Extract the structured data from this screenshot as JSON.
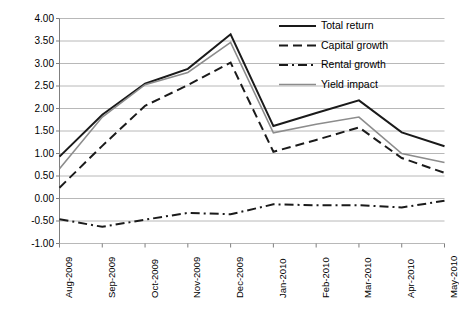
{
  "chart_data": {
    "type": "line",
    "title": "",
    "subtitle": "",
    "xlabel": "",
    "ylabel": "",
    "categories": [
      "Aug-2009",
      "Sep-2009",
      "Oct-2009",
      "Nov-2009",
      "Dec-2009",
      "Jan-2010",
      "Feb-2010",
      "Mar-2010",
      "Apr-2010",
      "May-2010"
    ],
    "ylim": [
      -1.0,
      4.0
    ],
    "ytick_labels": [
      "4.00",
      "3.50",
      "3.00",
      "2.50",
      "2.00",
      "1.50",
      "1.00",
      "0.50",
      "0.00",
      "-0.50",
      "-1.00"
    ],
    "ytick_values": [
      4.0,
      3.5,
      3.0,
      2.5,
      2.0,
      1.5,
      1.0,
      0.5,
      0.0,
      -0.5,
      -1.0
    ],
    "grid": true,
    "grid_axis": "y",
    "legend_position": "top-right",
    "series": [
      {
        "name": "Total return",
        "style": "solid",
        "color": "#1a1a1a",
        "width": 2.0,
        "values": [
          0.93,
          1.86,
          2.55,
          2.88,
          3.65,
          1.61,
          1.9,
          2.18,
          1.47,
          1.16
        ]
      },
      {
        "name": "Capital growth",
        "style": "dashed",
        "color": "#1a1a1a",
        "width": 2.0,
        "values": [
          0.24,
          1.17,
          2.06,
          2.52,
          3.02,
          1.04,
          1.3,
          1.58,
          0.9,
          0.57
        ]
      },
      {
        "name": "Rental growth",
        "style": "dashdot",
        "color": "#1a1a1a",
        "width": 2.0,
        "values": [
          -0.46,
          -0.63,
          -0.47,
          -0.32,
          -0.35,
          -0.13,
          -0.15,
          -0.15,
          -0.2,
          -0.05
        ]
      },
      {
        "name": "Yield impact",
        "style": "solid",
        "color": "#8c8c8c",
        "width": 1.6,
        "values": [
          0.66,
          1.81,
          2.53,
          2.8,
          3.47,
          1.46,
          1.65,
          1.81,
          1.0,
          0.8
        ]
      }
    ]
  },
  "axes": {
    "y_axis_name": "value-axis",
    "x_axis_name": "category-axis"
  }
}
